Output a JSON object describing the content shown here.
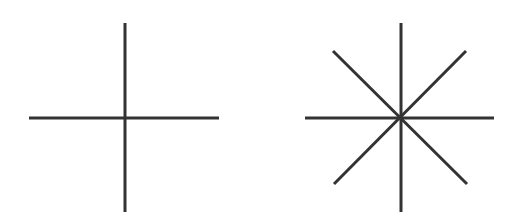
{
  "figure": {
    "background": "#ffffff",
    "stroke_color": "#333333",
    "stroke_width": 3,
    "shapes": [
      {
        "name": "plus-cross",
        "center": [
          125,
          118
        ],
        "lines": [
          {
            "x1": 125,
            "y1": 23,
            "x2": 125,
            "y2": 212
          },
          {
            "x1": 29,
            "y1": 118,
            "x2": 219,
            "y2": 118
          }
        ]
      },
      {
        "name": "eight-point-star",
        "center": [
          401,
          118
        ],
        "lines": [
          {
            "x1": 401,
            "y1": 23,
            "x2": 401,
            "y2": 212
          },
          {
            "x1": 305,
            "y1": 118,
            "x2": 494,
            "y2": 118
          },
          {
            "x1": 333,
            "y1": 51,
            "x2": 467,
            "y2": 184
          },
          {
            "x1": 466,
            "y1": 51,
            "x2": 334,
            "y2": 184
          }
        ]
      }
    ]
  }
}
